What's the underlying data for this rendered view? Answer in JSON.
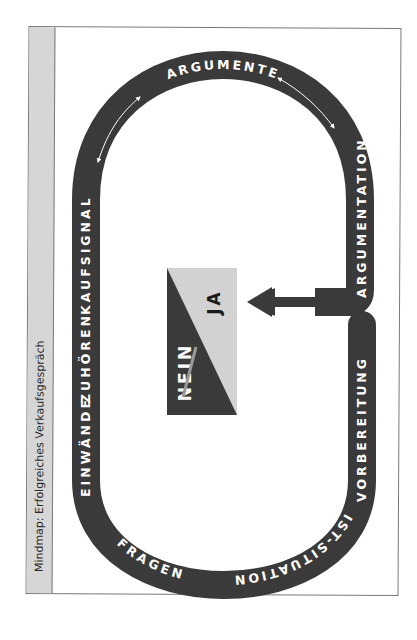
{
  "title": "Mindmap: Erfolgreiches Verkaufsgespräch",
  "track_labels": {
    "vorbereitung": "VORBEREITUNG",
    "ist_situation": "IST-SITUATION",
    "fragen": "FRAGEN",
    "einwaende": "EINWÄNDE",
    "zuhoeren": "ZUHÖREN",
    "kaufsignale": "KAUFSIGNALE",
    "argumente": "ARGUMENTE",
    "argumentation": "ARGUMENTATION"
  },
  "center_box": {
    "no_label": "NEIN",
    "yes_label": "JA",
    "no_struck_through": true
  },
  "colors": {
    "track": "#3a3a3a",
    "sidebar": "#d6d6d6",
    "box_light": "#d2d2d2",
    "box_dark": "#3a3a3a",
    "strike": "#9a9a9a"
  }
}
